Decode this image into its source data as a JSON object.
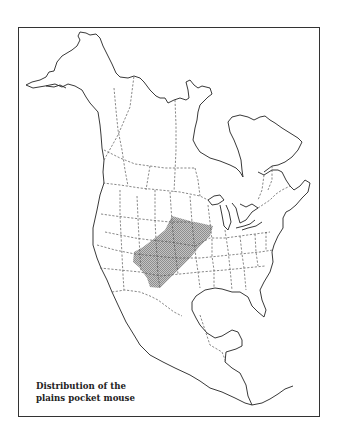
{
  "map": {
    "title": "Distribution of the plains pocket mouse",
    "caption_lines": [
      "Distribution of the",
      "plains pocket mouse"
    ],
    "region": "North America",
    "species": "plains pocket mouse",
    "legend": {
      "range_label": "Distribution range",
      "range_fill": "#9a9a9a"
    },
    "colors": {
      "coastline": "#222222",
      "borders": "#555555",
      "frame": "#333333",
      "background": "#ffffff"
    }
  }
}
